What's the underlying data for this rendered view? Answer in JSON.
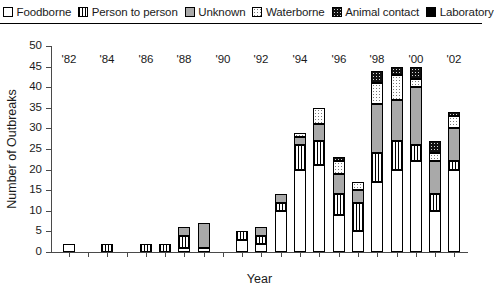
{
  "legend": {
    "position": "top",
    "items": [
      {
        "label": "Foodborne",
        "key": "foodborne",
        "swatch": "white-square-icon",
        "color": "#ffffff"
      },
      {
        "label": "Person to person",
        "key": "person",
        "swatch": "vertical-hatch-square-icon",
        "color": "#ffffff"
      },
      {
        "label": "Unknown",
        "key": "unknown",
        "swatch": "gray-square-icon",
        "color": "#a9a9a9"
      },
      {
        "label": "Waterborne",
        "key": "waterborne",
        "swatch": "dotted-square-icon",
        "color": "#ffffff"
      },
      {
        "label": "Animal contact",
        "key": "animal",
        "swatch": "dark-dotted-square-icon",
        "color": "#111111"
      },
      {
        "label": "Laboratory",
        "key": "laboratory",
        "swatch": "black-square-icon",
        "color": "#000000"
      }
    ]
  },
  "chart_data": {
    "type": "bar",
    "stacked": true,
    "title": "",
    "xlabel": "Year",
    "ylabel": "Number of Outbreaks",
    "ylim": [
      0,
      50
    ],
    "ytick_step": 5,
    "yticks": [
      0,
      5,
      10,
      15,
      20,
      25,
      30,
      35,
      40,
      45,
      50
    ],
    "grid": false,
    "legend_position": "top",
    "x": [
      1982,
      1983,
      1984,
      1985,
      1986,
      1987,
      1988,
      1989,
      1990,
      1991,
      1992,
      1993,
      1994,
      1995,
      1996,
      1997,
      1998,
      1999,
      2000,
      2001,
      2002
    ],
    "categories": [
      "'82",
      "",
      "'84",
      "",
      "'86",
      "",
      "'88",
      "",
      "'90",
      "",
      "'92",
      "",
      "'94",
      "",
      "'96",
      "",
      "'98",
      "",
      "'00",
      "",
      "'02"
    ],
    "xtick_labels": [
      "'82",
      "'84",
      "'86",
      "'88",
      "'90",
      "'92",
      "'94",
      "'96",
      "'98",
      "'00",
      "'02"
    ],
    "series": [
      {
        "name": "Foodborne",
        "values": [
          2,
          0,
          0,
          0,
          0,
          0,
          1,
          1,
          0,
          3,
          2,
          10,
          20,
          21,
          9,
          5,
          17,
          20,
          22,
          10,
          20
        ]
      },
      {
        "name": "Person to person",
        "values": [
          0,
          0,
          2,
          0,
          2,
          2,
          3,
          0,
          0,
          2,
          2,
          2,
          6,
          6,
          5,
          7,
          7,
          7,
          4,
          4,
          2
        ]
      },
      {
        "name": "Unknown",
        "values": [
          0,
          0,
          0,
          0,
          0,
          0,
          2,
          6,
          0,
          0,
          2,
          2,
          2,
          4,
          5,
          3,
          12,
          10,
          14,
          8,
          8
        ]
      },
      {
        "name": "Waterborne",
        "values": [
          0,
          0,
          0,
          0,
          0,
          0,
          0,
          0,
          0,
          0,
          0,
          0,
          1,
          4,
          3,
          2,
          5,
          6,
          2,
          2,
          3
        ]
      },
      {
        "name": "Animal contact",
        "values": [
          0,
          0,
          0,
          0,
          0,
          0,
          0,
          0,
          0,
          0,
          0,
          0,
          0,
          0,
          1,
          0,
          3,
          2,
          3,
          3,
          1
        ]
      },
      {
        "name": "Laboratory",
        "values": [
          0,
          0,
          0,
          0,
          0,
          0,
          0,
          0,
          0,
          0,
          0,
          0,
          0,
          0,
          0,
          0,
          0,
          0,
          0,
          0,
          0
        ]
      }
    ],
    "totals": [
      2,
      0,
      2,
      0,
      2,
      2,
      6,
      7,
      0,
      5,
      6,
      14,
      29,
      35,
      23,
      17,
      44,
      45,
      45,
      27,
      34
    ]
  }
}
